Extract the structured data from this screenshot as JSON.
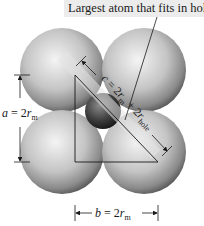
{
  "figure": {
    "callout_label": "Largest atom that fits in hole",
    "labels": {
      "a": {
        "var": "a",
        "eq": " = 2r",
        "sub": "m"
      },
      "b": {
        "var": "b",
        "eq": " = 2r",
        "sub": "m"
      },
      "c": {
        "text_prefix": "c = 2r",
        "sub1": "m",
        "mid": " + 2r",
        "sub2": "hole"
      }
    },
    "colors": {
      "sphere_light": "#f2f2f2",
      "sphere_dark": "#5a5a5a",
      "hole_atom_light": "#8a8a8a",
      "hole_atom_dark": "#1e1e1e",
      "line": "#1a1a1a",
      "label_band": "#e0e0e0"
    },
    "shapes": {
      "large_spheres": 4,
      "hole_atom": 1,
      "triangle": "right triangle with legs a, b and hypotenuse c"
    }
  }
}
